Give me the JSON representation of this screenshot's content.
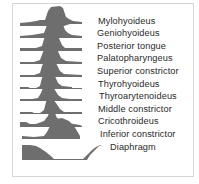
{
  "figure": {
    "fill_color": "#6e6e6e",
    "rows": [
      {
        "label": "Mylohyoideus",
        "label_x": 98,
        "label_y": 16,
        "path": "M20,26 L20,23 L30,22 L36,21 L40,20 L45,20 L48,11 L51,7 L60,6 L63,8 L66,17 L69,19 L73,21 L82,22 L82,24 L70,24 L64,26 Z"
      },
      {
        "label": "Geniohyoideus",
        "label_x": 97,
        "label_y": 28,
        "path": "M20,38 L20,36 L32,35 L38,34 L44,33 L47,25 L50,20 L58,19 L62,22 L65,30 L68,33 L72,35 L82,36 L82,38 Z"
      },
      {
        "label": "Posterior tongue",
        "label_x": 97,
        "label_y": 41,
        "path": "M20,51 L20,48 L36,48 L42,46 L44,39 L47,33 L55,32 L58,36 L62,45 L65,48 L82,48 L82,51 Z"
      },
      {
        "label": "Palatopharyngeus",
        "label_x": 97,
        "label_y": 53,
        "path": "M20,64 L20,62 L34,62 L40,60 L43,52 L46,45 L53,44 L57,49 L61,58 L66,61 L82,62 L82,64 Z"
      },
      {
        "label": "Superior constrictor",
        "label_x": 97,
        "label_y": 66,
        "path": "M20,77 L20,75 L34,75 L40,73 L42,66 L46,58 L52,57 L56,63 L60,71 L64,74 L82,75 L82,77 Z"
      },
      {
        "label": "Thyrohyoideus",
        "label_x": 98,
        "label_y": 79,
        "path": "M20,89 L20,87 L28,87 L30,88 L36,88 L40,86 L42,78 L45,71 L51,70 L54,74 L58,83 L62,86 L72,87 L72,88 L82,88 L82,89 Z"
      },
      {
        "label": "Thyroarytenoideus",
        "label_x": 99,
        "label_y": 91,
        "path": "M20,101 L20,99 L32,99 L38,98 L41,93 L44,85 L48,83 L52,85 L55,90 L58,95 L62,98 L70,99 L82,99 L82,101 Z"
      },
      {
        "label": "Middle constrictor",
        "label_x": 98,
        "label_y": 104,
        "path": "M20,114 L20,112 L32,112 L34,113 L40,113 L44,110 L46,102 L48,98 L52,98 L56,103 L60,109 L64,112 L82,112 L82,114 Z"
      },
      {
        "label": "Cricothroideus",
        "label_x": 98,
        "label_y": 116,
        "path": "M20,127 L20,122 L26,122 L30,124 L36,124 L44,121 L48,116 L50,108 L52,106 L54,111 L57,118 L62,121 L68,123 L80,125 L82,126 L82,127 Z"
      },
      {
        "label": "Inferior constrictor",
        "label_x": 100,
        "label_y": 129,
        "path": "M22,139 L22,136 L34,137 L44,136 L47,132 L51,124 L56,119 L62,118 L69,121 L74,126 L77,131 L80,136 L80,139 Z"
      }
    ],
    "diaphragm": {
      "label": "Diaphragm",
      "label_x": 110,
      "label_y": 142,
      "path": "M22,145 L30,145 L36,146 L40,148 L46,152 L52,157 L54,159 L54,160 L22,160 Z",
      "path2": "M82,160 L86,156 L92,150 L96,147 L100,145 L102,145 L99,146 L95,150 L90,155 L87,160 Z",
      "baseline": "M22,159.5 L86,159.5"
    }
  }
}
